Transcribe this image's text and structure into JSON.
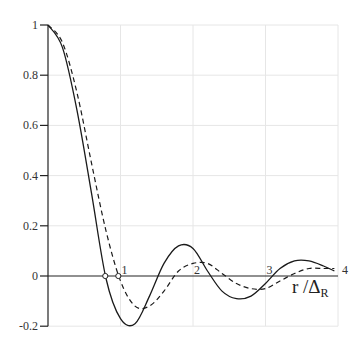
{
  "chart_data": {
    "type": "line",
    "title": "",
    "xlabel": "r / Δ_R",
    "xlabel_main": "r /Δ",
    "xlabel_sub": "R",
    "ylabel": "",
    "xlim": [
      0,
      4
    ],
    "ylim": [
      -0.2,
      1
    ],
    "grid": true,
    "x_ticks": [
      "1",
      "2",
      "3",
      "4"
    ],
    "y_ticks": [
      "1",
      "0.8",
      "0.6",
      "0.4",
      "0.2",
      "0",
      "-0.2"
    ],
    "legend": null,
    "series": [
      {
        "name": "solid",
        "style": "solid",
        "x": [
          0,
          0.2,
          0.4,
          0.6,
          0.8,
          1.0,
          1.2,
          1.4,
          1.6,
          1.8,
          2.0,
          2.2,
          2.4,
          2.6,
          2.8,
          3.0,
          3.2,
          3.4,
          3.6,
          3.8,
          3.95
        ],
        "values": [
          1.0,
          0.91,
          0.66,
          0.33,
          -0.01,
          -0.17,
          -0.19,
          -0.08,
          0.05,
          0.12,
          0.11,
          0.02,
          -0.06,
          -0.09,
          -0.08,
          -0.03,
          0.03,
          0.06,
          0.06,
          0.04,
          0.02
        ]
      },
      {
        "name": "dashed",
        "style": "dashed",
        "x": [
          0,
          0.2,
          0.4,
          0.6,
          0.8,
          1.0,
          1.2,
          1.4,
          1.6,
          1.8,
          2.0,
          2.2,
          2.4,
          2.6,
          2.8,
          3.0,
          3.2,
          3.4,
          3.6,
          3.8,
          3.95
        ],
        "values": [
          1.0,
          0.93,
          0.73,
          0.45,
          0.18,
          -0.02,
          -0.12,
          -0.12,
          -0.06,
          0.02,
          0.05,
          0.05,
          0.01,
          -0.03,
          -0.05,
          -0.05,
          -0.02,
          0.01,
          0.03,
          0.03,
          0.03
        ]
      }
    ],
    "annotations": [
      {
        "type": "marker",
        "shape": "open-circle",
        "x": 0.79,
        "y": 0,
        "note": "first zero of solid curve"
      },
      {
        "type": "marker",
        "shape": "open-circle",
        "x": 0.97,
        "y": 0,
        "note": "first zero of dashed curve"
      }
    ]
  }
}
